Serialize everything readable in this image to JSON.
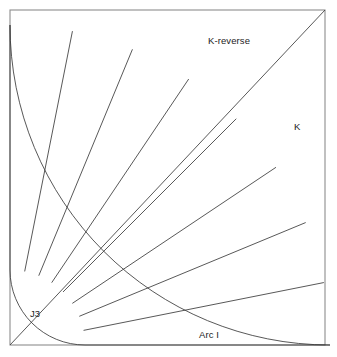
{
  "diagram": {
    "background_color": "#ffffff",
    "frame": {
      "name": "outer-frame",
      "x": 10,
      "y": 10,
      "width": 315,
      "height": 335,
      "stroke_color": "#8d8d8d",
      "stroke_width": 1.1
    },
    "geometry": {
      "center_x": 10,
      "center_y": 345,
      "inner_radius": 75,
      "outer_radius": 320,
      "start_angle_deg": 0,
      "end_angle_deg": 90,
      "sector_count": 8,
      "spoke_count": 7,
      "spoke_angles_deg": [
        11.25,
        22.5,
        33.75,
        45,
        56.25,
        67.5,
        78.75
      ],
      "line_color": "#3a3a3a",
      "line_width": 0.85,
      "diagonal": {
        "name": "k-divider-diagonal",
        "angle_deg": 45,
        "from_x": 10,
        "from_y": 345,
        "to_x": 325,
        "to_y": 10
      }
    },
    "labels": [
      {
        "id": "k-reverse",
        "text": "K-reverse",
        "x": 208,
        "y": 36
      },
      {
        "id": "k",
        "text": "K",
        "x": 294,
        "y": 122
      },
      {
        "id": "j3",
        "text": "J3",
        "x": 30,
        "y": 309
      },
      {
        "id": "arc-i",
        "text": "Arc I",
        "x": 199,
        "y": 330
      }
    ],
    "label_text": {
      "k_reverse": "K-reverse",
      "k": "K",
      "j3": "J3",
      "arc_i": "Arc I"
    }
  }
}
